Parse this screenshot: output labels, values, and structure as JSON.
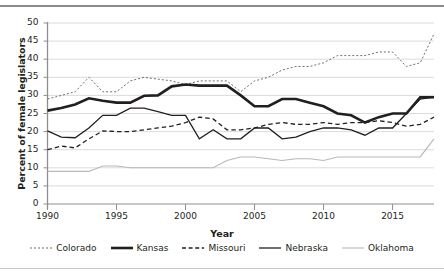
{
  "chart_data": {
    "type": "line",
    "title": "",
    "xlabel": "Year",
    "ylabel": "Percent of female legislators",
    "xlim": [
      1990,
      2018
    ],
    "ylim": [
      0,
      50
    ],
    "ytick_labels": [
      "0",
      "5",
      "10",
      "15",
      "20",
      "25",
      "30",
      "35",
      "40",
      "45",
      "50"
    ],
    "ytick_values": [
      0,
      5,
      10,
      15,
      20,
      25,
      30,
      35,
      40,
      45,
      50
    ],
    "xtick_labels": [
      "1990",
      "1995",
      "2000",
      "2005",
      "2010",
      "2015"
    ],
    "xtick_values": [
      1990,
      1995,
      2000,
      2005,
      2010,
      2015
    ],
    "grid": "horizontal",
    "legend_position": "bottom",
    "x": [
      1990,
      1991,
      1992,
      1993,
      1994,
      1995,
      1996,
      1997,
      1998,
      1999,
      2000,
      2001,
      2002,
      2003,
      2004,
      2005,
      2006,
      2007,
      2008,
      2009,
      2010,
      2011,
      2012,
      2013,
      2014,
      2015,
      2016,
      2017,
      2018
    ],
    "series": [
      {
        "name": "Colorado",
        "style": "dotted",
        "color": "#6f6f6f",
        "width": 1,
        "values": [
          29.0,
          30.0,
          31.0,
          35.0,
          31.0,
          31.0,
          34.0,
          35.0,
          34.5,
          34.0,
          33.0,
          34.0,
          34.0,
          34.0,
          31.0,
          34.0,
          35.0,
          37.0,
          38.0,
          38.0,
          39.0,
          41.0,
          41.0,
          41.0,
          42.0,
          42.0,
          38.0,
          39.0,
          47.0
        ]
      },
      {
        "name": "Kansas",
        "style": "solid",
        "color": "#231f20",
        "width": 2.6,
        "values": [
          25.8,
          26.5,
          27.5,
          29.2,
          28.5,
          28.0,
          28.0,
          29.9,
          30.0,
          32.5,
          33.0,
          32.7,
          32.7,
          32.7,
          30.0,
          27.0,
          27.0,
          29.0,
          29.0,
          28.0,
          27.0,
          25.0,
          24.5,
          22.5,
          24.0,
          25.0,
          25.0,
          29.5,
          29.5
        ]
      },
      {
        "name": "Missouri",
        "style": "dashed",
        "color": "#231f20",
        "width": 1.3,
        "values": [
          15.0,
          16.0,
          15.5,
          18.0,
          20.2,
          20.0,
          20.0,
          20.5,
          21.0,
          21.5,
          22.5,
          24.0,
          23.5,
          20.5,
          20.5,
          21.0,
          22.0,
          22.5,
          22.0,
          22.0,
          22.5,
          22.0,
          22.5,
          22.5,
          23.0,
          22.5,
          21.5,
          22.0,
          24.0
        ]
      },
      {
        "name": "Nebraska",
        "style": "solid",
        "color": "#231f20",
        "width": 1.3,
        "values": [
          20.2,
          18.5,
          18.3,
          21.0,
          24.5,
          24.5,
          26.5,
          26.5,
          25.5,
          24.5,
          24.5,
          18.0,
          20.5,
          18.0,
          18.0,
          21.0,
          21.0,
          18.0,
          18.5,
          20.0,
          21.0,
          21.0,
          20.5,
          19.0,
          21.0,
          21.0,
          25.0,
          29.0,
          29.5
        ]
      },
      {
        "name": "Oklahoma",
        "style": "solid",
        "color": "#b8b8b8",
        "width": 1.1,
        "values": [
          9.0,
          9.0,
          9.0,
          9.0,
          10.5,
          10.5,
          10.0,
          10.0,
          10.0,
          10.0,
          10.0,
          10.0,
          10.0,
          12.0,
          13.0,
          13.0,
          12.5,
          12.0,
          12.5,
          12.5,
          12.0,
          13.0,
          13.0,
          13.0,
          13.0,
          13.0,
          13.0,
          13.0,
          18.0
        ]
      }
    ]
  },
  "legend": {
    "items": [
      {
        "label": "Colorado",
        "swatch": "dotted-light-line"
      },
      {
        "label": "Kansas",
        "swatch": "thick-solid-line"
      },
      {
        "label": "Missouri",
        "swatch": "dashed-line"
      },
      {
        "label": "Nebraska",
        "swatch": "solid-line"
      },
      {
        "label": "Oklahoma",
        "swatch": "light-solid-line"
      }
    ]
  }
}
